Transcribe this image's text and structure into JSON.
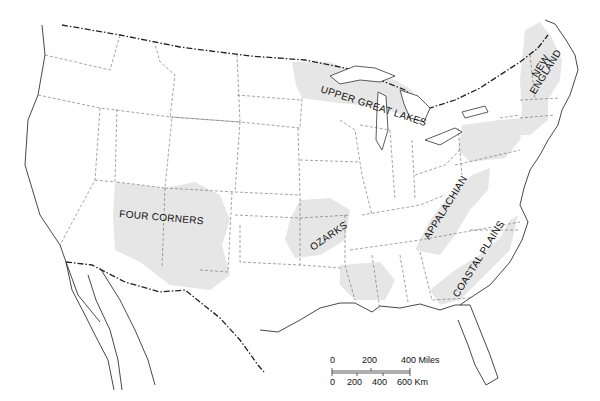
{
  "map": {
    "type": "Outline map of the contiguous United States",
    "regions": [
      {
        "id": "upper-great-lakes",
        "label": "UPPER GREAT LAKES"
      },
      {
        "id": "new-england",
        "label_line1": "NEW",
        "label_line2": "ENGLAND"
      },
      {
        "id": "four-corners",
        "label": "FOUR CORNERS"
      },
      {
        "id": "ozarks",
        "label": "OZARKS"
      },
      {
        "id": "appalachian",
        "label": "APPALACHIAN"
      },
      {
        "id": "coastal-plains",
        "label": "COASTAL PLAINS"
      }
    ],
    "colors": {
      "region_fill": "#e6e6e6",
      "background": "#ffffff",
      "lines": "#333333"
    }
  },
  "scale_bar": {
    "miles": {
      "ticks": [
        "0",
        "200",
        "400 Miles"
      ]
    },
    "km": {
      "ticks": [
        "0",
        "200",
        "400",
        "600 Km"
      ]
    }
  }
}
